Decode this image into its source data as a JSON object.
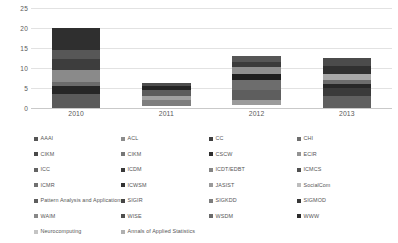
{
  "chart_data": {
    "type": "bar",
    "stacked": true,
    "title": "",
    "xlabel": "",
    "ylabel": "",
    "categories": [
      "2010",
      "2011",
      "2012",
      "2013"
    ],
    "ylim": [
      0,
      25
    ],
    "yticks": [
      0,
      5,
      10,
      15,
      20,
      25
    ],
    "grid": true,
    "legend_position": "bottom",
    "totals": [
      20,
      6.2,
      13.1,
      12.4
    ],
    "bar_bases": [
      0,
      0.4,
      0.8,
      0
    ],
    "series": [
      {
        "name": "AAAI",
        "color": "#555555",
        "values": [
          3.5,
          0,
          0,
          0
        ]
      },
      {
        "name": "ACL",
        "color": "#8c8c8c",
        "values": [
          0,
          0,
          0,
          0
        ]
      },
      {
        "name": "CC",
        "color": "#3f3f3f",
        "values": [
          0,
          0,
          0,
          0
        ]
      },
      {
        "name": "CHI",
        "color": "#6e6e6e",
        "values": [
          0,
          0,
          0,
          0
        ]
      },
      {
        "name": "CIKM",
        "color": "#4a4a4a",
        "values": [
          0,
          0,
          0,
          0
        ]
      },
      {
        "name": "CIKM ",
        "color": "#777777",
        "values": [
          0,
          0,
          0,
          0
        ]
      },
      {
        "name": "CSCW",
        "color": "#2e2e2e",
        "values": [
          0,
          0,
          0,
          0
        ]
      },
      {
        "name": "ECIR",
        "color": "#939393",
        "values": [
          0,
          0,
          0,
          0
        ]
      },
      {
        "name": "ICC",
        "color": "#636363",
        "values": [
          0,
          0,
          0,
          0
        ]
      },
      {
        "name": "ICDM",
        "color": "#3a3a3a",
        "values": [
          0,
          0,
          0,
          0
        ]
      },
      {
        "name": "ICDT/EDBT",
        "color": "#858585",
        "values": [
          0,
          0,
          0,
          0
        ]
      },
      {
        "name": "ICMCS",
        "color": "#515151",
        "values": [
          0,
          0,
          0,
          0
        ]
      },
      {
        "name": "ICMR",
        "color": "#707070",
        "values": [
          0,
          0,
          0,
          0
        ]
      },
      {
        "name": "ICWSM",
        "color": "#333333",
        "values": [
          0,
          0,
          0,
          0
        ]
      },
      {
        "name": "JASIST",
        "color": "#9a9a9a",
        "values": [
          0,
          0,
          0,
          0
        ]
      },
      {
        "name": "SocialCom",
        "color": "#bdbdbd",
        "values": [
          0,
          0,
          0,
          0
        ]
      },
      {
        "name": "Pattern Analysis and Applications",
        "color": "#5d5d5d",
        "values": [
          0,
          0,
          0,
          0
        ]
      },
      {
        "name": "SIGIR",
        "color": "#464646",
        "values": [
          0,
          0,
          0,
          0
        ]
      },
      {
        "name": "SIGKDD",
        "color": "#7d7d7d",
        "values": [
          0,
          0,
          0,
          0
        ]
      },
      {
        "name": "SIGMOD",
        "color": "#383838",
        "values": [
          0,
          0,
          0,
          0
        ]
      },
      {
        "name": "WAIM",
        "color": "#888888",
        "values": [
          0,
          0,
          0,
          0
        ]
      },
      {
        "name": "WISE",
        "color": "#4f4f4f",
        "values": [
          0,
          0,
          0,
          0
        ]
      },
      {
        "name": "WSDM",
        "color": "#6a6a6a",
        "values": [
          0,
          0,
          0,
          0
        ]
      },
      {
        "name": "WWW",
        "color": "#2b2b2b",
        "values": [
          0,
          0,
          0,
          0
        ]
      },
      {
        "name": "Neurocomputing",
        "color": "#c4c4c4",
        "values": [
          0,
          0,
          0,
          0
        ]
      },
      {
        "name": "Annals of Applied Statistics",
        "color": "#b0b0b0",
        "values": [
          0,
          0,
          0,
          0
        ]
      }
    ],
    "stacks": [
      {
        "category": "2010",
        "base": 0,
        "segments": [
          {
            "from": 0,
            "to": 3.5,
            "color": "#5a5a5a"
          },
          {
            "from": 3.5,
            "to": 5.4,
            "color": "#262626"
          },
          {
            "from": 5.4,
            "to": 6.4,
            "color": "#6b6b6b"
          },
          {
            "from": 6.4,
            "to": 9.6,
            "color": "#8a8a8a"
          },
          {
            "from": 9.6,
            "to": 12.2,
            "color": "#3d3d3d"
          },
          {
            "from": 12.2,
            "to": 14.6,
            "color": "#575757"
          },
          {
            "from": 14.6,
            "to": 20.0,
            "color": "#2f2f2f"
          }
        ]
      },
      {
        "category": "2011",
        "base": 0.4,
        "segments": [
          {
            "from": 0.4,
            "to": 2.0,
            "color": "#7e7e7e"
          },
          {
            "from": 2.0,
            "to": 3.1,
            "color": "#a0a0a0"
          },
          {
            "from": 3.1,
            "to": 4.4,
            "color": "#5c5c5c"
          },
          {
            "from": 4.4,
            "to": 5.5,
            "color": "#242424"
          },
          {
            "from": 5.5,
            "to": 6.2,
            "color": "#4d4d4d"
          }
        ]
      },
      {
        "category": "2012",
        "base": 0.8,
        "segments": [
          {
            "from": 0.8,
            "to": 1.9,
            "color": "#9b9b9b"
          },
          {
            "from": 1.9,
            "to": 4.4,
            "color": "#5e5e5e"
          },
          {
            "from": 4.4,
            "to": 6.9,
            "color": "#6d6d6d"
          },
          {
            "from": 6.9,
            "to": 8.4,
            "color": "#1f1f1f"
          },
          {
            "from": 8.4,
            "to": 10.3,
            "color": "#8f8f8f"
          },
          {
            "from": 10.3,
            "to": 11.6,
            "color": "#3b3b3b"
          },
          {
            "from": 11.6,
            "to": 13.1,
            "color": "#565656"
          }
        ]
      },
      {
        "category": "2013",
        "base": 0,
        "segments": [
          {
            "from": 0,
            "to": 3.0,
            "color": "#5f5f5f"
          },
          {
            "from": 3.0,
            "to": 4.9,
            "color": "#3a3a3a"
          },
          {
            "from": 4.9,
            "to": 6.0,
            "color": "#272727"
          },
          {
            "from": 6.0,
            "to": 7.1,
            "color": "#6c6c6c"
          },
          {
            "from": 7.1,
            "to": 8.6,
            "color": "#a8a8a8"
          },
          {
            "from": 8.6,
            "to": 10.6,
            "color": "#303030"
          },
          {
            "from": 10.6,
            "to": 12.4,
            "color": "#4b4b4b"
          }
        ]
      }
    ],
    "legend_columns": [
      [
        {
          "label": "AAAI",
          "color": "#555555"
        },
        {
          "label": "CIKM",
          "color": "#4a4a4a"
        },
        {
          "label": "ICC",
          "color": "#636363"
        },
        {
          "label": "ICMR",
          "color": "#707070"
        },
        {
          "label": "Pattern Analysis and Applications",
          "color": "#5d5d5d"
        },
        {
          "label": "WAIM",
          "color": "#888888"
        },
        {
          "label": "Neurocomputing",
          "color": "#c4c4c4"
        }
      ],
      [
        {
          "label": "ACL",
          "color": "#8c8c8c"
        },
        {
          "label": "CIKM",
          "color": "#777777"
        },
        {
          "label": "ICDM",
          "color": "#3a3a3a"
        },
        {
          "label": "ICWSM",
          "color": "#333333"
        },
        {
          "label": "SIGIR",
          "color": "#464646"
        },
        {
          "label": "WISE",
          "color": "#4f4f4f"
        },
        {
          "label": "Annals of Applied Statistics",
          "color": "#b0b0b0"
        }
      ],
      [
        {
          "label": "CC",
          "color": "#3f3f3f"
        },
        {
          "label": "CSCW",
          "color": "#2e2e2e"
        },
        {
          "label": "ICDT/EDBT",
          "color": "#858585"
        },
        {
          "label": "JASIST",
          "color": "#9a9a9a"
        },
        {
          "label": "SIGKDD",
          "color": "#7d7d7d"
        },
        {
          "label": "WSDM",
          "color": "#6a6a6a"
        }
      ],
      [
        {
          "label": "CHI",
          "color": "#6e6e6e"
        },
        {
          "label": "ECIR",
          "color": "#939393"
        },
        {
          "label": "ICMCS",
          "color": "#515151"
        },
        {
          "label": "SocialCom",
          "color": "#bdbdbd"
        },
        {
          "label": "SIGMOD",
          "color": "#383838"
        },
        {
          "label": "WWW",
          "color": "#2b2b2b"
        }
      ]
    ]
  }
}
